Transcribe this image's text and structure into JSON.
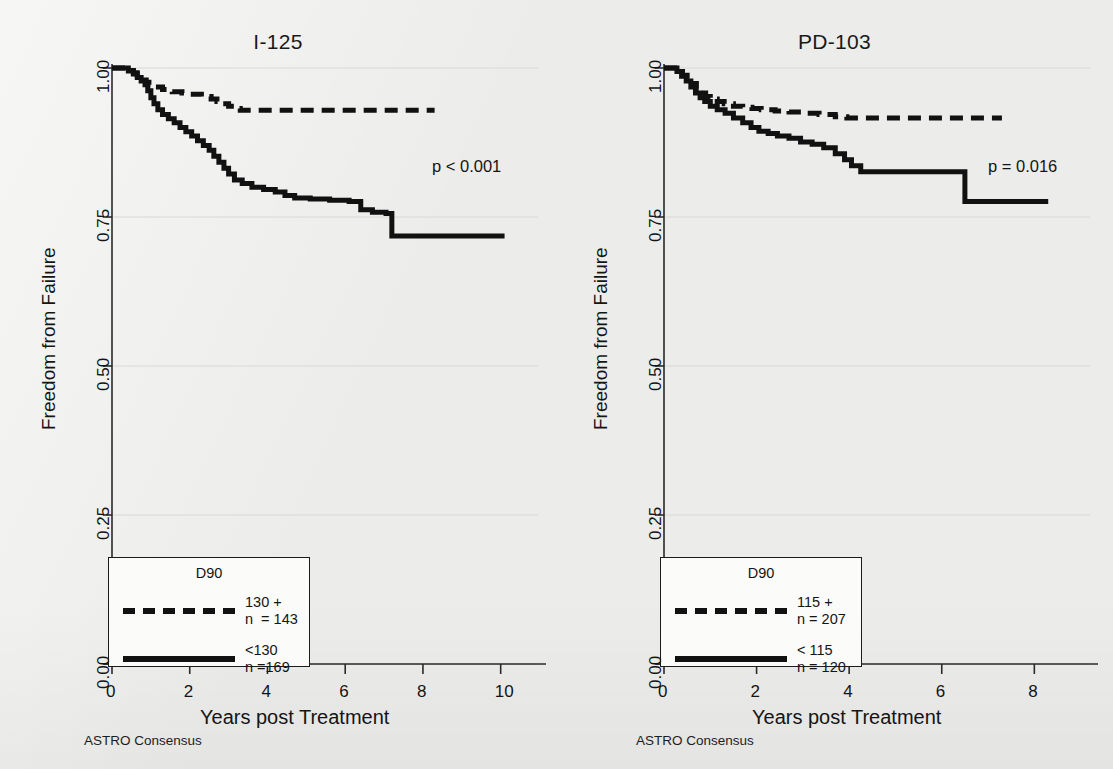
{
  "figure": {
    "background_color": "#ececea",
    "line_color": "#111111",
    "gridline_color": "#d8d8d4"
  },
  "chart_data": [
    {
      "type": "line",
      "panel_id": "left",
      "title": "I-125",
      "xlabel": "Years post Treatment",
      "ylabel": "Freedom from Failure",
      "footnote": "ASTRO Consensus",
      "annotation": "p < 0.001",
      "grid": true,
      "legend_position": "bottom-left",
      "xlim": [
        0,
        10.6
      ],
      "ylim": [
        0,
        1
      ],
      "xticks": [
        0,
        2,
        4,
        6,
        8,
        10
      ],
      "xtick_labels": [
        "0",
        "2",
        "4",
        "6",
        "8",
        "10"
      ],
      "yticks": [
        0.0,
        0.25,
        0.5,
        0.75,
        1.0
      ],
      "ytick_labels": [
        "0.00",
        "0.25",
        "0.50",
        "0.75",
        "1.00"
      ],
      "legend_title": "D90",
      "series": [
        {
          "name": "130 +",
          "n_label": "n  = 143",
          "style": "dashed",
          "x": [
            0.0,
            0.35,
            0.45,
            0.55,
            0.65,
            0.72,
            0.8,
            0.88,
            0.95,
            1.02,
            1.1,
            1.3,
            1.55,
            1.8,
            2.0,
            2.3,
            2.55,
            2.7,
            2.85,
            3.0,
            3.15,
            3.3,
            8.3
          ],
          "y": [
            1.0,
            1.0,
            0.996,
            0.992,
            0.988,
            0.984,
            0.98,
            0.976,
            0.972,
            0.968,
            0.968,
            0.964,
            0.96,
            0.958,
            0.956,
            0.952,
            0.948,
            0.944,
            0.94,
            0.936,
            0.932,
            0.929,
            0.929
          ]
        },
        {
          "name": "<130",
          "n_label": "n =169",
          "style": "solid",
          "x": [
            0.0,
            0.3,
            0.42,
            0.55,
            0.65,
            0.75,
            0.85,
            0.92,
            1.0,
            1.08,
            1.18,
            1.3,
            1.45,
            1.6,
            1.75,
            1.9,
            2.05,
            2.2,
            2.35,
            2.5,
            2.62,
            2.75,
            2.88,
            3.0,
            3.15,
            3.35,
            3.6,
            3.9,
            4.2,
            4.45,
            4.7,
            5.1,
            5.6,
            6.1,
            6.4,
            6.7,
            7.05,
            7.2,
            10.1
          ],
          "y": [
            1.0,
            1.0,
            0.995,
            0.99,
            0.984,
            0.978,
            0.972,
            0.962,
            0.95,
            0.94,
            0.93,
            0.922,
            0.915,
            0.908,
            0.9,
            0.893,
            0.886,
            0.878,
            0.87,
            0.862,
            0.852,
            0.842,
            0.832,
            0.822,
            0.812,
            0.806,
            0.8,
            0.796,
            0.792,
            0.786,
            0.782,
            0.78,
            0.778,
            0.776,
            0.762,
            0.758,
            0.756,
            0.718,
            0.718
          ]
        }
      ]
    },
    {
      "type": "line",
      "panel_id": "right",
      "title": "PD-103",
      "xlabel": "Years post Treatment",
      "ylabel": "Freedom from Failure",
      "footnote": "ASTRO Consensus",
      "annotation": "p = 0.016",
      "grid": true,
      "legend_position": "bottom-left",
      "xlim": [
        0,
        8.9
      ],
      "ylim": [
        0,
        1
      ],
      "xticks": [
        0,
        2,
        4,
        6,
        8
      ],
      "xtick_labels": [
        "0",
        "2",
        "4",
        "6",
        "8"
      ],
      "yticks": [
        0.0,
        0.25,
        0.5,
        0.75,
        1.0
      ],
      "ytick_labels": [
        "0.00",
        "0.25",
        "0.50",
        "0.75",
        "1.00"
      ],
      "legend_title": "D90",
      "series": [
        {
          "name": "115 +",
          "n_label": "n = 207",
          "style": "dashed",
          "x": [
            0.0,
            0.2,
            0.3,
            0.4,
            0.5,
            0.6,
            0.7,
            0.8,
            0.9,
            1.0,
            1.15,
            1.3,
            1.5,
            1.7,
            1.9,
            2.1,
            2.4,
            2.7,
            3.0,
            3.35,
            3.7,
            3.95,
            7.3
          ],
          "y": [
            1.0,
            1.0,
            0.994,
            0.988,
            0.982,
            0.974,
            0.966,
            0.958,
            0.952,
            0.948,
            0.944,
            0.94,
            0.936,
            0.934,
            0.932,
            0.93,
            0.928,
            0.926,
            0.924,
            0.922,
            0.918,
            0.916,
            0.916
          ]
        },
        {
          "name": "< 115",
          "n_label": "n = 120",
          "style": "solid",
          "x": [
            0.0,
            0.18,
            0.28,
            0.38,
            0.48,
            0.58,
            0.68,
            0.78,
            0.88,
            1.0,
            1.15,
            1.32,
            1.5,
            1.7,
            1.88,
            2.05,
            2.25,
            2.45,
            2.7,
            2.95,
            3.2,
            3.45,
            3.7,
            3.9,
            4.05,
            4.25,
            6.4,
            6.5,
            8.3
          ],
          "y": [
            1.0,
            1.0,
            0.994,
            0.986,
            0.978,
            0.968,
            0.958,
            0.95,
            0.944,
            0.936,
            0.93,
            0.924,
            0.916,
            0.908,
            0.9,
            0.894,
            0.89,
            0.886,
            0.882,
            0.876,
            0.872,
            0.866,
            0.856,
            0.846,
            0.836,
            0.826,
            0.826,
            0.776,
            0.776
          ]
        }
      ]
    }
  ]
}
